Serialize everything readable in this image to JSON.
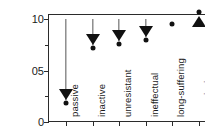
{
  "chart_data": {
    "type": "scatter",
    "title": "",
    "xlabel": "",
    "ylabel_prefix": "t",
    "ylabel_subscript": "r",
    "ylabel": "relative transinformation",
    "ylim": [
      0,
      1.05
    ],
    "yticks": [
      0,
      0.5,
      1.0
    ],
    "ytick_labels": [
      "0",
      "05",
      "10"
    ],
    "grid": false,
    "legend": false,
    "baseline": 1.0,
    "categories": [
      "passive",
      "inactive",
      "unresistant",
      "ineffectual",
      "long-suffering",
      "permissive"
    ],
    "values": [
      0.21,
      0.75,
      0.79,
      0.83,
      0.95,
      1.03
    ],
    "markers": [
      "triangle-down",
      "triangle-down",
      "triangle-down",
      "triangle-down",
      "dot",
      "triangle-up"
    ],
    "dropline": [
      true,
      true,
      true,
      true,
      false,
      false
    ],
    "points": [
      {
        "category": "passive",
        "value": 0.21,
        "marker": "triangle-down",
        "dropline": true
      },
      {
        "category": "inactive",
        "value": 0.75,
        "marker": "triangle-down",
        "dropline": true
      },
      {
        "category": "unresistant",
        "value": 0.79,
        "marker": "triangle-down",
        "dropline": true
      },
      {
        "category": "ineffectual",
        "value": 0.83,
        "marker": "triangle-down",
        "dropline": true
      },
      {
        "category": "long-suffering",
        "value": 0.95,
        "marker": "dot",
        "dropline": false
      },
      {
        "category": "permissive",
        "value": 1.03,
        "marker": "triangle-up",
        "dropline": false
      }
    ],
    "colors": {
      "marker": "#111111",
      "axis": "#2b2b2b",
      "dropline": "#555555",
      "background": "#ffffff"
    }
  }
}
